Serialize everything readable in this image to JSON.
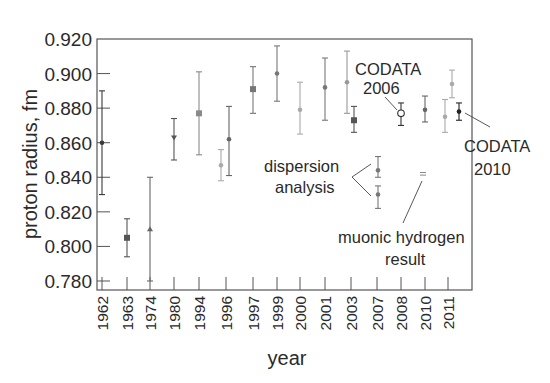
{
  "chart_data": {
    "type": "scatter",
    "title": "",
    "xlabel": "year",
    "ylabel": "proton radius, fm",
    "ylim": [
      0.778,
      0.92
    ],
    "yticks": [
      "0.920",
      "0.900",
      "0.880",
      "0.860",
      "0.840",
      "0.820",
      "0.800",
      "0.780"
    ],
    "ytick_values": [
      0.92,
      0.9,
      0.88,
      0.86,
      0.84,
      0.82,
      0.8,
      0.78
    ],
    "categories": [
      "1962",
      "1963",
      "1974",
      "1980",
      "1994",
      "1996",
      "1997",
      "1999",
      "2000",
      "2001",
      "2003",
      "2007",
      "2008",
      "2010",
      "2011"
    ],
    "grid": false,
    "legend": null,
    "points": [
      {
        "year": "1962",
        "value": 0.86,
        "low": 0.83,
        "high": 0.89,
        "marker": "dot",
        "color": "#3a3a3a"
      },
      {
        "year": "1963",
        "value": 0.805,
        "low": 0.794,
        "high": 0.816,
        "marker": "square",
        "color": "#555555"
      },
      {
        "year": "1974",
        "value": 0.81,
        "low": 0.78,
        "high": 0.84,
        "marker": "triangle",
        "color": "#666666"
      },
      {
        "year": "1980",
        "value": 0.863,
        "low": 0.85,
        "high": 0.874,
        "marker": "triangle-down",
        "color": "#555555"
      },
      {
        "year": "1994",
        "value": 0.877,
        "low": 0.853,
        "high": 0.901,
        "marker": "square",
        "color": "#8a8a8a"
      },
      {
        "year": "1996",
        "value": 0.847,
        "low": 0.838,
        "high": 0.856,
        "marker": "dot",
        "color": "#aaaaaa",
        "offset": -5
      },
      {
        "year": "1996",
        "value": 0.862,
        "low": 0.841,
        "high": 0.881,
        "marker": "dot",
        "color": "#666666",
        "offset": 3
      },
      {
        "year": "1997",
        "value": 0.891,
        "low": 0.877,
        "high": 0.904,
        "marker": "square",
        "color": "#777777"
      },
      {
        "year": "1999",
        "value": 0.9,
        "low": 0.884,
        "high": 0.916,
        "marker": "dot",
        "color": "#777777"
      },
      {
        "year": "2000",
        "value": 0.879,
        "low": 0.865,
        "high": 0.895,
        "marker": "dot",
        "color": "#aaaaaa"
      },
      {
        "year": "2001",
        "value": 0.892,
        "low": 0.873,
        "high": 0.909,
        "marker": "dot",
        "color": "#777777"
      },
      {
        "year": "2003",
        "value": 0.895,
        "low": 0.877,
        "high": 0.913,
        "marker": "dot",
        "color": "#999999",
        "offset": -4
      },
      {
        "year": "2003",
        "value": 0.873,
        "low": 0.866,
        "high": 0.881,
        "marker": "square",
        "color": "#555555",
        "offset": 3
      },
      {
        "year": "2007",
        "value": 0.844,
        "low": 0.84,
        "high": 0.852,
        "marker": "dot",
        "color": "#777777",
        "group": "dispersion analysis"
      },
      {
        "year": "2007",
        "value": 0.83,
        "low": 0.822,
        "high": 0.835,
        "marker": "dot",
        "color": "#777777",
        "group": "dispersion analysis"
      },
      {
        "year": "2008",
        "value": 0.877,
        "low": 0.87,
        "high": 0.883,
        "marker": "open-circle",
        "color": "#333333",
        "label": "CODATA 2006"
      },
      {
        "year": "2008",
        "value": 0.842,
        "low": 0.842,
        "high": 0.842,
        "marker": "equals",
        "color": "#888888",
        "label": "muonic hydrogen result",
        "offset": 22
      },
      {
        "year": "2010",
        "value": 0.879,
        "low": 0.872,
        "high": 0.887,
        "marker": "dot",
        "color": "#666666"
      },
      {
        "year": "2011",
        "value": 0.875,
        "low": 0.866,
        "high": 0.885,
        "marker": "dot",
        "color": "#aaaaaa",
        "offset": -3
      },
      {
        "year": "2011",
        "value": 0.894,
        "low": 0.886,
        "high": 0.902,
        "marker": "dot",
        "color": "#aaaaaa",
        "offset": 4
      },
      {
        "year": "2011",
        "value": 0.878,
        "low": 0.873,
        "high": 0.883,
        "marker": "dot",
        "color": "#222222",
        "offset": 11,
        "label": "CODATA 2010"
      }
    ],
    "annotations": [
      {
        "lines": [
          "CODATA",
          "2006"
        ],
        "target": "CODATA 2006"
      },
      {
        "lines": [
          "CODATA",
          "2010"
        ],
        "target": "CODATA 2010"
      },
      {
        "lines": [
          "dispersion",
          "analysis"
        ],
        "target": "dispersion analysis"
      },
      {
        "lines": [
          "muonic hydrogen",
          "result"
        ],
        "target": "muonic hydrogen result"
      }
    ]
  },
  "labels": {
    "ylabel": "proton radius, fm",
    "xlabel": "year",
    "codata2006_l1": "CODATA",
    "codata2006_l2": "2006",
    "codata2010_l1": "CODATA",
    "codata2010_l2": "2010",
    "dispersion_l1": "dispersion",
    "dispersion_l2": "analysis",
    "muonic_l1": "muonic hydrogen",
    "muonic_l2": "result"
  }
}
